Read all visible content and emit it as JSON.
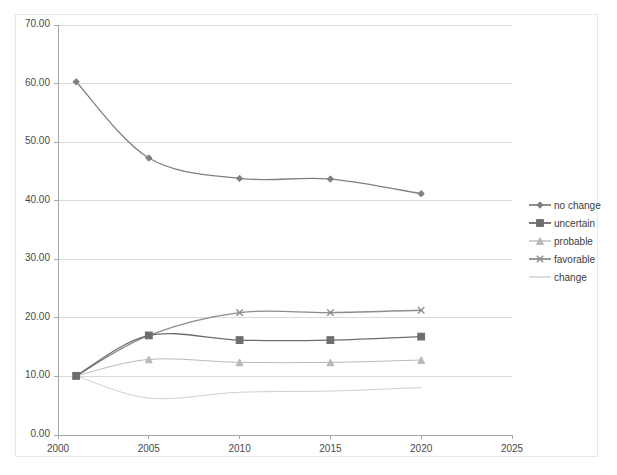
{
  "chart_data": {
    "type": "line",
    "title": "",
    "xlabel": "",
    "ylabel": "",
    "xlim": [
      2000,
      2025
    ],
    "ylim": [
      0,
      70
    ],
    "grid": true,
    "legend_position": "right",
    "x": [
      2001,
      2005,
      2010,
      2015,
      2020
    ],
    "xticks": [
      "2000",
      "2005",
      "2010",
      "2015",
      "2020",
      "2025"
    ],
    "yticks": [
      "0.00",
      "10.00",
      "20.00",
      "30.00",
      "40.00",
      "50.00",
      "60.00",
      "70.00"
    ],
    "series": [
      {
        "name": "no change",
        "marker": "diamond",
        "color": "#808080",
        "values": [
          60.3,
          47.3,
          43.8,
          43.7,
          41.2
        ]
      },
      {
        "name": "uncertain",
        "marker": "square",
        "color": "#6e6e6e",
        "values": [
          10.1,
          17.0,
          16.2,
          16.2,
          16.8
        ]
      },
      {
        "name": "probable",
        "marker": "triangle",
        "color": "#b9b9b9",
        "values": [
          10.1,
          12.9,
          12.4,
          12.4,
          12.8
        ]
      },
      {
        "name": "favorable",
        "marker": "cross",
        "color": "#8c8c8c",
        "values": [
          10.1,
          17.0,
          20.9,
          20.9,
          21.3
        ]
      },
      {
        "name": "change",
        "marker": "none",
        "color": "#cfcfcf",
        "values": [
          10.1,
          6.3,
          7.3,
          7.5,
          8.1
        ]
      }
    ]
  },
  "legend": {
    "items": [
      {
        "label": "no change"
      },
      {
        "label": "uncertain"
      },
      {
        "label": "probable"
      },
      {
        "label": "favorable"
      },
      {
        "label": "change"
      }
    ]
  },
  "axes": {
    "y_labels": [
      "70.00",
      "60.00",
      "50.00",
      "40.00",
      "30.00",
      "20.00",
      "10.00",
      "0.00"
    ],
    "x_labels": [
      "2000",
      "2005",
      "2010",
      "2015",
      "2020",
      "2025"
    ]
  },
  "colors": {
    "grid": "#d9d9d9",
    "axis": "#a6a6a6",
    "frame": "#e8e8e8",
    "text": "#4a4a4a"
  }
}
